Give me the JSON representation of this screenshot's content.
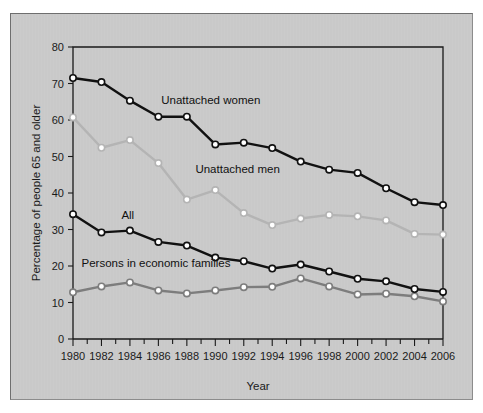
{
  "figure": {
    "panel_background": "#c9c9c9",
    "frame_color": "#1a1a1a"
  },
  "chart_data": {
    "type": "line",
    "title": "",
    "subtitle": "",
    "xlabel": "Year",
    "ylabel": "Percentage of people 65 and older",
    "xlim": [
      1980,
      2006
    ],
    "ylim": [
      0,
      80
    ],
    "ytick_step": 10,
    "yticks": [
      0,
      10,
      20,
      30,
      40,
      50,
      60,
      70,
      80
    ],
    "ytick_labels": [
      "0",
      "10",
      "20",
      "30",
      "40",
      "50",
      "60",
      "70",
      "80"
    ],
    "xticks": [
      1980,
      1981,
      1982,
      1983,
      1984,
      1985,
      1986,
      1987,
      1988,
      1989,
      1990,
      1991,
      1992,
      1993,
      1994,
      1995,
      1996,
      1997,
      1998,
      1999,
      2000,
      2001,
      2002,
      2003,
      2004,
      2005,
      2006
    ],
    "xtick_labels_shown": [
      "1980",
      "1982",
      "1984",
      "1986",
      "1988",
      "1990",
      "1992",
      "1994",
      "1996",
      "1998",
      "2000",
      "2002",
      "2004",
      "2006"
    ],
    "x": [
      1980,
      1982,
      1984,
      1986,
      1988,
      1990,
      1992,
      1994,
      1996,
      1998,
      2000,
      2002,
      2004,
      2006
    ],
    "grid": false,
    "legend_position": "inline-annotations",
    "series": [
      {
        "name": "Unattached women",
        "color": "#111111",
        "marker": "open-circle",
        "label_x": 1986.2,
        "label_y": 64.5,
        "values": [
          71.5,
          70.4,
          65.3,
          60.9,
          60.9,
          53.3,
          53.8,
          52.3,
          48.6,
          46.4,
          45.5,
          41.3,
          37.5,
          36.7
        ]
      },
      {
        "name": "Unattached men",
        "color": "#b4b4b4",
        "marker": "open-circle",
        "label_x": 1988.6,
        "label_y": 45.6,
        "values": [
          60.7,
          52.4,
          54.5,
          48.2,
          38.2,
          40.8,
          34.5,
          31.2,
          33.0,
          34.0,
          33.6,
          32.5,
          28.8,
          28.6
        ]
      },
      {
        "name": "All",
        "color": "#111111",
        "marker": "open-circle",
        "label_x": 1983.4,
        "label_y": 32.8,
        "values": [
          34.2,
          29.2,
          29.7,
          26.6,
          25.6,
          22.3,
          21.3,
          19.3,
          20.4,
          18.5,
          16.5,
          15.8,
          13.7,
          12.9
        ]
      },
      {
        "name": "Persons in economic families",
        "color": "#7d7d7d",
        "marker": "open-circle",
        "label_x": 1980.6,
        "label_y": 19.8,
        "values": [
          12.8,
          14.4,
          15.5,
          13.3,
          12.5,
          13.3,
          14.2,
          14.3,
          16.6,
          14.4,
          12.2,
          12.4,
          11.7,
          10.3
        ]
      }
    ]
  }
}
